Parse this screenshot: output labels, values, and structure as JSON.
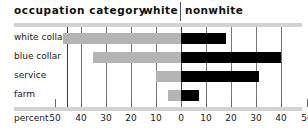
{
  "header": {
    "category_title": "occupation category",
    "left_side_title": "white",
    "right_side_title": "nonwhite"
  },
  "axis": {
    "percent_label": "percent",
    "tick_labels": [
      "50",
      "40",
      "30",
      "20",
      "10",
      "0",
      "10",
      "20",
      "30",
      "40",
      "50"
    ]
  },
  "colors": {
    "white_bar": "#b4b4b4",
    "nonwhite_bar": "#000000",
    "rule": "#d2d2d2",
    "gridline": "#777777",
    "axis": "#3a3a3a",
    "text": "#1a1a1a"
  },
  "chart_data": {
    "type": "bar",
    "title": "occupation category",
    "xlabel": "percent",
    "ylabel": "",
    "orientation": "horizontal",
    "layout": "back-to-back bilateral bar chart",
    "xlim": [
      -50,
      50
    ],
    "grid": true,
    "legend_position": "top",
    "categories": [
      "white collar",
      "blue collar",
      "service",
      "farm"
    ],
    "series": [
      {
        "name": "white",
        "side": "left",
        "values": [
          47,
          35,
          10,
          5
        ]
      },
      {
        "name": "nonwhite",
        "side": "right",
        "values": [
          18,
          40,
          31,
          7
        ]
      }
    ]
  },
  "categories": [
    {
      "label": "white collar",
      "white": 47,
      "nonwhite": 18
    },
    {
      "label": "blue collar",
      "white": 35,
      "nonwhite": 40
    },
    {
      "label": "service",
      "white": 10,
      "nonwhite": 31
    },
    {
      "label": "farm",
      "white": 5,
      "nonwhite": 7
    }
  ]
}
